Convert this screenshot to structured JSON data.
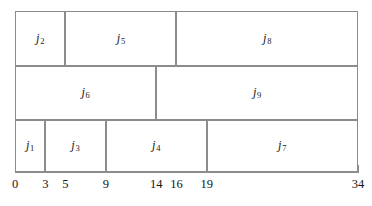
{
  "chart_data": {
    "type": "bar",
    "title": "",
    "subtitle": "",
    "xlabel": "",
    "ylabel": "",
    "orientation": "horizontal",
    "xlim": [
      0,
      34
    ],
    "grid": false,
    "legend": false,
    "axis_tick_values": [
      0,
      3,
      5,
      9,
      14,
      16,
      19,
      34
    ],
    "axis_tick_labels": [
      "0",
      "3",
      "5",
      "9",
      "14",
      "16",
      "19",
      "34"
    ],
    "axis_ticks_with_marks": [
      0,
      3,
      9,
      19,
      34
    ],
    "rows": [
      {
        "row_index": 0,
        "blocks": [
          {
            "label": "j",
            "subscript": "2",
            "start": 0,
            "end": 5
          },
          {
            "label": "j",
            "subscript": "5",
            "start": 5,
            "end": 16
          },
          {
            "label": "j",
            "subscript": "8",
            "start": 16,
            "end": 34
          }
        ]
      },
      {
        "row_index": 1,
        "blocks": [
          {
            "label": "j",
            "subscript": "6",
            "start": 0,
            "end": 14
          },
          {
            "label": "j",
            "subscript": "9",
            "start": 14,
            "end": 34
          }
        ]
      },
      {
        "row_index": 2,
        "blocks": [
          {
            "label": "j",
            "subscript": "1",
            "start": 0,
            "end": 3
          },
          {
            "label": "j",
            "subscript": "3",
            "start": 3,
            "end": 9
          },
          {
            "label": "j",
            "subscript": "4",
            "start": 9,
            "end": 19
          },
          {
            "label": "j",
            "subscript": "7",
            "start": 19,
            "end": 34
          }
        ]
      }
    ],
    "colors": {
      "stroke": "#8c8c8c",
      "fill": "#ffffff",
      "text": "#1a1a1a",
      "background": "#ffffff"
    }
  },
  "geometry": {
    "plot_left": 15,
    "plot_right": 358,
    "plot_top": 11,
    "row_boundaries": [
      11,
      66,
      120,
      172
    ],
    "axis_y": 172,
    "tick_length": 7,
    "tick_label_y": 178
  }
}
